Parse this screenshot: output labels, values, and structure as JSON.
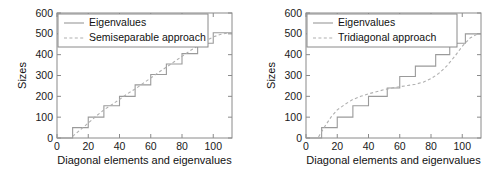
{
  "chart_data": [
    {
      "panel": "left",
      "type": "line",
      "title": "",
      "xlabel": "Diagonal elements and eigenvalues",
      "ylabel": "Sizes",
      "xlim": [
        0,
        112
      ],
      "ylim": [
        0,
        600
      ],
      "xticks": [
        0,
        20,
        40,
        60,
        80,
        100
      ],
      "yticks": [
        0,
        100,
        200,
        300,
        400,
        500,
        600
      ],
      "grid": false,
      "legend_position": "upper-left",
      "series": [
        {
          "name": "Eigenvalues",
          "style": "solid",
          "color": "#9a9a9a",
          "x": [
            0,
            10,
            10,
            20,
            20,
            30,
            30,
            40,
            40,
            50,
            50,
            60,
            60,
            70,
            70,
            80,
            80,
            90,
            90,
            100,
            100,
            112
          ],
          "values": [
            0,
            0,
            50,
            50,
            100,
            100,
            155,
            155,
            200,
            200,
            255,
            255,
            305,
            305,
            355,
            355,
            405,
            405,
            455,
            455,
            505,
            505
          ]
        },
        {
          "name": "Semiseparable approach",
          "style": "dashed",
          "color": "#b0b0b0",
          "x": [
            10,
            15,
            20,
            25,
            30,
            35,
            40,
            45,
            50,
            55,
            60,
            65,
            70,
            75,
            80,
            85,
            90,
            95,
            100,
            105,
            110
          ],
          "values": [
            8,
            40,
            72,
            105,
            135,
            160,
            185,
            212,
            235,
            262,
            288,
            315,
            340,
            366,
            392,
            418,
            442,
            465,
            485,
            498,
            505
          ]
        }
      ]
    },
    {
      "panel": "right",
      "type": "line",
      "title": "",
      "xlabel": "Diagonal elements and eigenvalues",
      "ylabel": "Sizes",
      "xlim": [
        0,
        112
      ],
      "ylim": [
        0,
        600
      ],
      "xticks": [
        0,
        20,
        40,
        60,
        80,
        100
      ],
      "yticks": [
        0,
        100,
        200,
        300,
        400,
        500,
        600
      ],
      "grid": false,
      "legend_position": "upper-left",
      "series": [
        {
          "name": "Eigenvalues",
          "style": "solid",
          "color": "#9a9a9a",
          "x": [
            0,
            10,
            10,
            20,
            20,
            30,
            30,
            40,
            40,
            52,
            52,
            60,
            60,
            70,
            70,
            83,
            83,
            92,
            92,
            102,
            102,
            112
          ],
          "values": [
            0,
            0,
            50,
            50,
            100,
            100,
            155,
            155,
            200,
            200,
            240,
            240,
            295,
            295,
            345,
            345,
            400,
            400,
            455,
            455,
            500,
            500
          ]
        },
        {
          "name": "Tridiagonal approach",
          "style": "dashed",
          "color": "#b0b0b0",
          "x": [
            8,
            12,
            16,
            20,
            25,
            30,
            35,
            40,
            45,
            50,
            55,
            60,
            65,
            70,
            75,
            80,
            85,
            90,
            95,
            100,
            105,
            110
          ],
          "values": [
            5,
            55,
            100,
            135,
            162,
            185,
            200,
            212,
            222,
            232,
            240,
            246,
            252,
            258,
            268,
            285,
            310,
            345,
            390,
            440,
            480,
            500
          ]
        }
      ]
    }
  ],
  "panels": {
    "left": {
      "legend": {
        "entries": [
          {
            "label": "Eigenvalues",
            "style": "solid"
          },
          {
            "label": "Semiseparable approach",
            "style": "dashed"
          }
        ]
      },
      "xlabel": "Diagonal elements and eigenvalues",
      "ylabel": "Sizes",
      "xticks": [
        "0",
        "20",
        "40",
        "60",
        "80",
        "100"
      ],
      "yticks": [
        "0",
        "100",
        "200",
        "300",
        "400",
        "500",
        "600"
      ]
    },
    "right": {
      "legend": {
        "entries": [
          {
            "label": "Eigenvalues",
            "style": "solid"
          },
          {
            "label": "Tridiagonal approach",
            "style": "dashed"
          }
        ]
      },
      "xlabel": "Diagonal elements and eigenvalues",
      "ylabel": "Sizes",
      "xticks": [
        "0",
        "20",
        "40",
        "60",
        "80",
        "100"
      ],
      "yticks": [
        "0",
        "100",
        "200",
        "300",
        "400",
        "500",
        "600"
      ]
    }
  },
  "colors": {
    "axis": "#8a8a8a",
    "solid_series": "#9a9a9a",
    "dashed_series": "#b0b0b0",
    "text": "#111111",
    "background": "#ffffff"
  }
}
